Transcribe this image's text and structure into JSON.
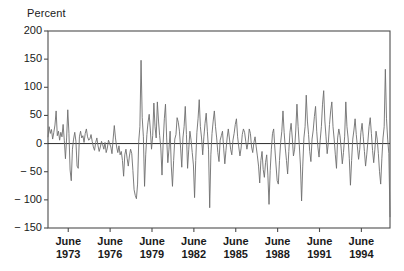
{
  "chart_data": {
    "type": "line",
    "title": "",
    "subtitle": "",
    "xlabel": "",
    "ylabel": "Percent",
    "ylim": [
      -150,
      200
    ],
    "yticks": [
      200,
      150,
      100,
      50,
      0,
      -50,
      -100,
      -150
    ],
    "ytick_labels": [
      "200",
      "150",
      "100",
      "50",
      "0",
      "− 50",
      "− 100",
      "− 150"
    ],
    "xlim": [
      1972.0,
      1996.5
    ],
    "xticks": [
      1973.45,
      1976.45,
      1979.45,
      1982.45,
      1985.45,
      1988.45,
      1991.45,
      1994.45
    ],
    "xtick_labels": [
      {
        "month": "June",
        "year": "1973"
      },
      {
        "month": "June",
        "year": "1976"
      },
      {
        "month": "June",
        "year": "1979"
      },
      {
        "month": "June",
        "year": "1982"
      },
      {
        "month": "June",
        "year": "1985"
      },
      {
        "month": "June",
        "year": "1988"
      },
      {
        "month": "June",
        "year": "1991"
      },
      {
        "month": "June",
        "year": "1994"
      }
    ],
    "grid": false,
    "legend": null,
    "zero_line": 0,
    "line_color": "#6e6e6e",
    "axis_color": "#4d4d4d",
    "background_color": "#ffffff",
    "x_start": 1972.0,
    "x_step": 0.0833333,
    "series": [
      {
        "name": "Percent change",
        "values": [
          12,
          30,
          18,
          25,
          8,
          20,
          33,
          58,
          14,
          22,
          6,
          20,
          12,
          34,
          6,
          -27,
          10,
          60,
          18,
          -47,
          -66,
          -10,
          8,
          20,
          4,
          -40,
          -44,
          12,
          22,
          10,
          14,
          2,
          18,
          26,
          12,
          6,
          8,
          16,
          4,
          -6,
          -12,
          2,
          10,
          -4,
          -14,
          -6,
          4,
          -2,
          -10,
          2,
          -16,
          -8,
          6,
          0,
          -6,
          -18,
          8,
          32,
          10,
          -6,
          -16,
          -4,
          -20,
          -14,
          -30,
          -58,
          -20,
          -10,
          -26,
          -40,
          -22,
          -10,
          -18,
          -48,
          -82,
          -92,
          -98,
          -72,
          4,
          30,
          148,
          46,
          12,
          -76,
          -20,
          16,
          38,
          52,
          24,
          -10,
          14,
          72,
          30,
          10,
          74,
          40,
          14,
          -8,
          -56,
          2,
          44,
          70,
          10,
          -34,
          -10,
          22,
          -40,
          -76,
          -30,
          8,
          16,
          46,
          38,
          22,
          -8,
          -42,
          10,
          30,
          66,
          16,
          -44,
          -10,
          22,
          6,
          -16,
          -38,
          -96,
          -30,
          20,
          44,
          78,
          30,
          10,
          -20,
          12,
          36,
          54,
          22,
          -10,
          -114,
          -20,
          18,
          40,
          58,
          30,
          10,
          -16,
          -32,
          6,
          14,
          22,
          -8,
          -36,
          -12,
          10,
          26,
          8,
          -10,
          -20,
          6,
          18,
          34,
          44,
          12,
          -6,
          -22,
          -8,
          16,
          26,
          20,
          4,
          -10,
          2,
          26,
          18,
          -6,
          -16,
          2,
          12,
          -6,
          -22,
          -40,
          -70,
          -30,
          -14,
          -46,
          -60,
          -34,
          -20,
          -56,
          -108,
          -48,
          -10,
          18,
          26,
          -8,
          -38,
          -66,
          -72,
          -30,
          2,
          22,
          58,
          20,
          -8,
          -30,
          -54,
          -14,
          20,
          36,
          10,
          -22,
          -10,
          24,
          70,
          30,
          -2,
          -38,
          -102,
          -40,
          10,
          30,
          86,
          40,
          16,
          -14,
          -32,
          8,
          24,
          48,
          66,
          22,
          -6,
          -24,
          6,
          30,
          70,
          94,
          40,
          12,
          -18,
          2,
          34,
          58,
          74,
          30,
          8,
          -20,
          -44,
          10,
          26,
          14,
          -8,
          -36,
          -16,
          12,
          74,
          30,
          10,
          -26,
          -74,
          -30,
          8,
          24,
          44,
          16,
          -6,
          -28,
          -10,
          20,
          36,
          12,
          -14,
          -40,
          -20,
          4,
          30,
          46,
          18,
          -12,
          -34,
          -10,
          22,
          8,
          -18,
          -50,
          -72,
          -26,
          10,
          30,
          132,
          44,
          8,
          -18,
          -130,
          -24,
          18,
          40,
          30,
          22,
          -10,
          36,
          28,
          14,
          -24,
          18,
          44,
          26,
          10,
          38,
          62,
          16
        ]
      }
    ]
  },
  "figure": {
    "plot_left": 48,
    "plot_right": 390,
    "plot_top": 31,
    "plot_bottom": 228
  }
}
